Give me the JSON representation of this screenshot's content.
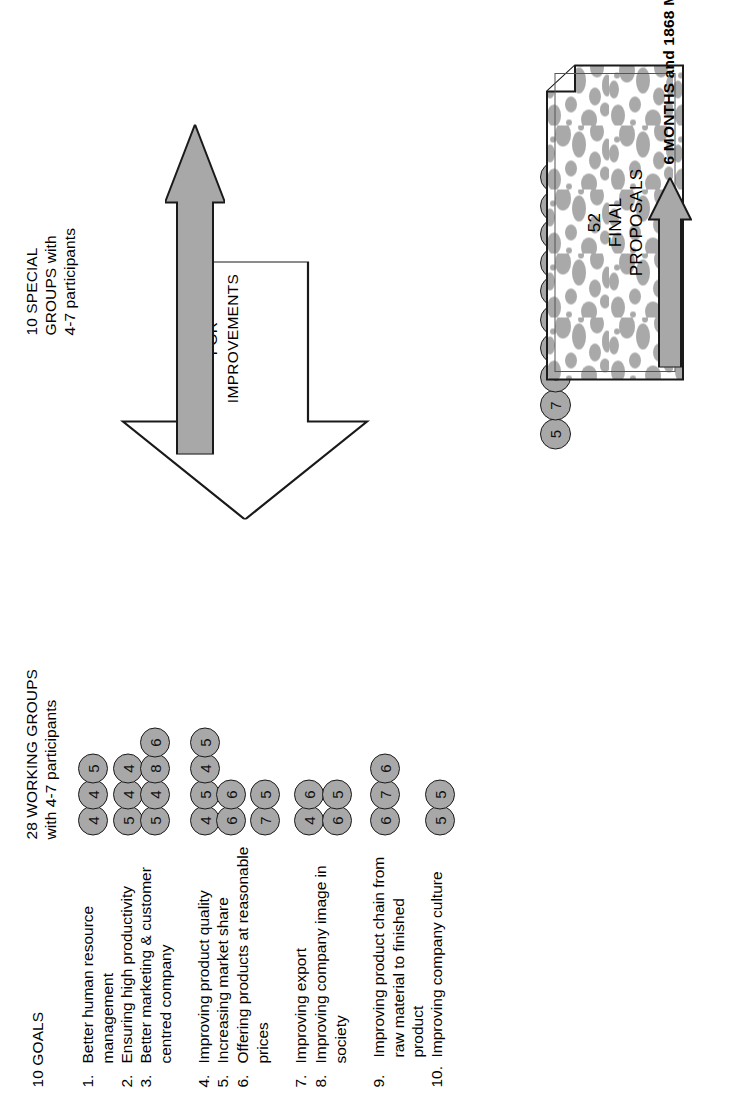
{
  "diagram": {
    "colors": {
      "circle_fill": "#a8a8a8",
      "circle_stroke": "#1a1a1a",
      "arrow_fill": "#a8a8a8",
      "arrow_stroke": "#1a1a1a",
      "doc_texture": "#a8a8a8",
      "text": "#000000"
    }
  },
  "headers": {
    "goals": "10 GOALS",
    "working_groups": "28 WORKING GROUPS\nwith 4-7 participants",
    "special_groups": "10 SPECIAL\nGROUPS with\n4-7 participants"
  },
  "goals": [
    {
      "num": "1.",
      "text": "Better human resource\nmanagement",
      "groups": [
        "4",
        "4",
        "5"
      ]
    },
    {
      "num": "2.",
      "text": "Ensuring high productivity",
      "groups": [
        "5",
        "4",
        "4"
      ]
    },
    {
      "num": "3.",
      "text": "Better marketing & customer\ncentred company",
      "groups": [
        "5",
        "4",
        "8",
        "6"
      ]
    },
    {
      "num": "4.",
      "text": "Improving product quality",
      "groups": [
        "4",
        "5",
        "4",
        "5"
      ]
    },
    {
      "num": "5.",
      "text": "Increasing market share",
      "groups": [
        "6",
        "6"
      ]
    },
    {
      "num": "6.",
      "text": "Offering products at reasonable\nprices",
      "groups": [
        "7",
        "5"
      ]
    },
    {
      "num": "7.",
      "text": "Improving export",
      "groups": [
        "4",
        "6"
      ]
    },
    {
      "num": "8.",
      "text": "Improving company image in\nsociety",
      "groups": [
        "6",
        "5"
      ]
    },
    {
      "num": "9.",
      "text": "Improving product chain from\nraw material to finished\nproduct",
      "groups": [
        "6",
        "7",
        "6"
      ]
    },
    {
      "num": "10.",
      "text": "Improving company culture",
      "groups": [
        "5",
        "5"
      ]
    }
  ],
  "special_groups": {
    "participants": [
      "5",
      "7",
      "6",
      "7",
      "7",
      "4",
      "5",
      "6",
      "9",
      "6"
    ]
  },
  "proposals_arrow": {
    "line1": "194 PROPOSALS",
    "line2": "FOR",
    "line3": "IMPROVEMENTS"
  },
  "final_document": {
    "count": "52",
    "line2": "FINAL",
    "line3": "PROPOSALS"
  },
  "duration": {
    "label": "6 MONTHS and 1868 MAN x HRS"
  }
}
